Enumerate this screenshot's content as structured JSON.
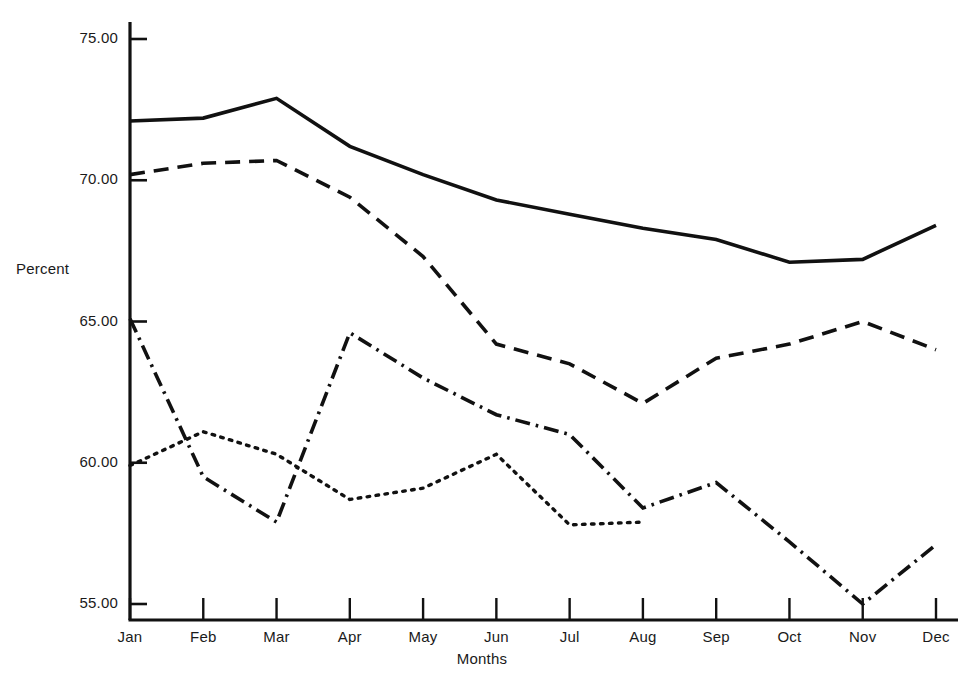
{
  "chart_data": {
    "type": "line",
    "title": "",
    "xlabel": "Months",
    "ylabel": "Percent",
    "categories": [
      "Jan",
      "Feb",
      "Mar",
      "Apr",
      "May",
      "Jun",
      "Jul",
      "Aug",
      "Sep",
      "Oct",
      "Nov",
      "Dec"
    ],
    "ylim": [
      55.0,
      75.0
    ],
    "yticks": [
      55.0,
      60.0,
      65.0,
      70.0,
      75.0
    ],
    "ytick_labels": [
      "55.00",
      "60.00",
      "65.00",
      "70.00",
      "75.00"
    ],
    "grid": false,
    "legend": "none",
    "series": [
      {
        "name": "series-solid",
        "style": "solid",
        "color": "#111111",
        "values": [
          72.1,
          72.2,
          72.9,
          71.2,
          70.2,
          69.3,
          68.8,
          68.3,
          67.9,
          67.1,
          67.2,
          68.4
        ]
      },
      {
        "name": "series-dashed",
        "style": "dashed",
        "color": "#111111",
        "values": [
          70.2,
          70.6,
          70.7,
          69.4,
          67.3,
          64.2,
          63.5,
          62.1,
          63.7,
          64.2,
          65.0,
          64.0
        ]
      },
      {
        "name": "series-dash-dot",
        "style": "dash-dot",
        "color": "#111111",
        "values": [
          65.1,
          59.5,
          57.9,
          64.6,
          63.0,
          61.7,
          61.0,
          58.4,
          59.3,
          57.2,
          55.0,
          57.1
        ]
      },
      {
        "name": "series-dotted",
        "style": "dotted",
        "color": "#111111",
        "values": [
          59.9,
          61.1,
          60.3,
          58.7,
          59.1,
          60.3,
          57.8,
          57.9,
          null,
          null,
          null,
          null
        ]
      }
    ]
  },
  "axes": {
    "y_axis_name": "percent-axis",
    "x_axis_name": "months-axis"
  }
}
